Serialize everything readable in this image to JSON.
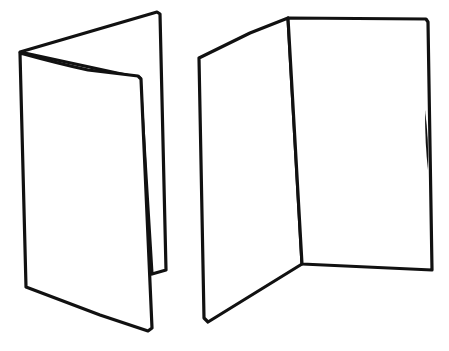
{
  "illustration": {
    "description": "Hand-drawn line sketch of two folded cards",
    "background": "#ffffff",
    "line_color": "#111111",
    "items": [
      {
        "name": "closed-folded-card",
        "state": "partially closed"
      },
      {
        "name": "open-folded-card",
        "state": "opened"
      }
    ]
  }
}
